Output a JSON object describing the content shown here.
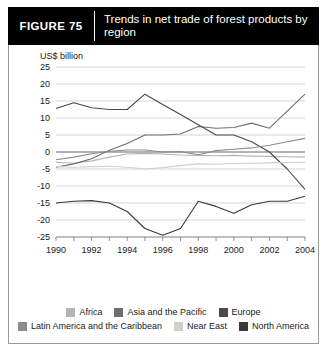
{
  "figure": {
    "tag": "FIGURE  75",
    "title": "Trends in net trade of forest products by region"
  },
  "chart_data": {
    "type": "line",
    "title": "Trends in net trade of forest products by region",
    "xlabel": "",
    "ylabel": "US$ billion",
    "yunit_label": "US$ billion",
    "x": [
      1990,
      1991,
      1992,
      1993,
      1994,
      1995,
      1996,
      1997,
      1998,
      1999,
      2000,
      2001,
      2002,
      2003,
      2004
    ],
    "xtick_labels": [
      "1990",
      "1992",
      "1994",
      "1996",
      "1998",
      "2000",
      "2002",
      "2004"
    ],
    "ytick_labels": [
      "25",
      "20",
      "15",
      "10",
      "5",
      "0",
      "-5",
      "-10",
      "-15",
      "-20",
      "-25"
    ],
    "ylim": [
      -25,
      25
    ],
    "xlim": [
      1990,
      2004
    ],
    "grid": true,
    "legend_position": "bottom",
    "series": [
      {
        "name": "Africa",
        "color": "#b4b4b4",
        "values": [
          -3.0,
          -3.3,
          -2.6,
          -1.5,
          -0.6,
          -0.4,
          -0.6,
          -0.9,
          -1.0,
          -1.1,
          -1.0,
          -1.2,
          -1.3,
          -1.4,
          -1.5
        ]
      },
      {
        "name": "Asia and the Pacific",
        "color": "#6e6e6e",
        "values": [
          -4.5,
          -3.5,
          -2.0,
          0.5,
          2.5,
          5.0,
          5.0,
          5.3,
          7.5,
          7.0,
          7.2,
          8.5,
          7.0,
          12.0,
          17.0
        ]
      },
      {
        "name": "Europe",
        "color": "#4a4a4a",
        "values": [
          12.8,
          14.5,
          13.0,
          12.5,
          12.5,
          17.0,
          14.0,
          11.0,
          8.0,
          5.0,
          5.0,
          3.0,
          0.0,
          -5.0,
          -11.0
        ]
      },
      {
        "name": "Latin America and the Caribbean",
        "color": "#8c8c8c",
        "values": [
          -2.3,
          -1.5,
          -0.5,
          0.2,
          0.6,
          0.6,
          0.0,
          0.1,
          -0.8,
          0.4,
          0.8,
          1.2,
          2.0,
          3.0,
          4.0
        ]
      },
      {
        "name": "Near East",
        "color": "#cfcfcf",
        "values": [
          -4.3,
          -4.5,
          -4.3,
          -4.2,
          -4.5,
          -5.0,
          -4.6,
          -4.0,
          -3.5,
          -3.6,
          -3.4,
          -3.3,
          -3.2,
          -3.1,
          -3.0
        ]
      },
      {
        "name": "North America",
        "color": "#3a3a3a",
        "values": [
          -15.0,
          -14.5,
          -14.3,
          -15.0,
          -17.5,
          -22.5,
          -24.5,
          -22.5,
          -14.5,
          -16.0,
          -18.0,
          -15.5,
          -14.5,
          -14.5,
          -13.0
        ]
      }
    ]
  }
}
